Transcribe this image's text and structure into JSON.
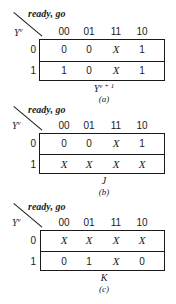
{
  "maps": [
    {
      "id": "a",
      "column_variables": "ready, go",
      "row_variable": "Y",
      "row_variable_sup": "v",
      "column_headers": [
        "00",
        "01",
        "11",
        "10"
      ],
      "row_headers": [
        "0",
        "1"
      ],
      "cells": [
        [
          "0",
          "0",
          "X",
          "1"
        ],
        [
          "1",
          "0",
          "X",
          "1"
        ]
      ],
      "function_label": "Y",
      "function_sup": "v + 1",
      "caption": "(a)"
    },
    {
      "id": "b",
      "column_variables": "ready, go",
      "row_variable": "Y",
      "row_variable_sup": "v",
      "column_headers": [
        "00",
        "01",
        "11",
        "10"
      ],
      "row_headers": [
        "0",
        "1"
      ],
      "cells": [
        [
          "0",
          "0",
          "X",
          "1"
        ],
        [
          "X",
          "X",
          "X",
          "X"
        ]
      ],
      "function_label": "J",
      "function_sup": "",
      "caption": "(b)"
    },
    {
      "id": "c",
      "column_variables": "ready, go",
      "row_variable": "Y",
      "row_variable_sup": "v",
      "column_headers": [
        "00",
        "01",
        "11",
        "10"
      ],
      "row_headers": [
        "0",
        "1"
      ],
      "cells": [
        [
          "X",
          "X",
          "X",
          "X"
        ],
        [
          "0",
          "1",
          "X",
          "0"
        ]
      ],
      "function_label": "K",
      "function_sup": "",
      "caption": "(c)"
    }
  ]
}
